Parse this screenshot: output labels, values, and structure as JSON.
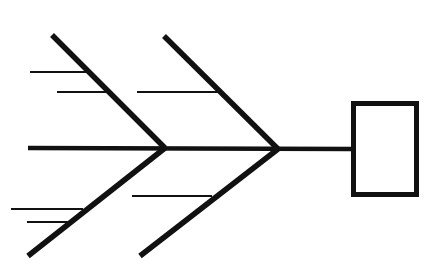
{
  "diagram": {
    "type": "fishbone",
    "width": 429,
    "height": 264,
    "stroke_color": "#111111",
    "background": "#ffffff",
    "spine": {
      "x1": 28,
      "y1": 148,
      "x2": 352,
      "y2": 149,
      "width": 4.5
    },
    "head_box": {
      "x": 353.5,
      "y": 103.5,
      "w": 63,
      "h": 91,
      "stroke_width": 5
    },
    "bones": [
      {
        "id": "upper-left",
        "x1": 52,
        "y1": 35,
        "x2": 165,
        "y2": 148,
        "width": 5.5
      },
      {
        "id": "upper-right",
        "x1": 164,
        "y1": 36,
        "x2": 278,
        "y2": 149,
        "width": 5.5
      },
      {
        "id": "lower-left",
        "x1": 28,
        "y1": 256,
        "x2": 165,
        "y2": 148,
        "width": 5.5
      },
      {
        "id": "lower-right",
        "x1": 140,
        "y1": 256,
        "x2": 278,
        "y2": 149,
        "width": 5.5
      }
    ],
    "twigs": [
      {
        "bone": "upper-left",
        "x1": 30,
        "y1": 72,
        "x2": 89,
        "y2": 72,
        "width": 2.2
      },
      {
        "bone": "upper-left",
        "x1": 57,
        "y1": 92,
        "x2": 108,
        "y2": 92,
        "width": 2.2
      },
      {
        "bone": "upper-right",
        "x1": 137,
        "y1": 92,
        "x2": 221,
        "y2": 92,
        "width": 2.2
      },
      {
        "bone": "lower-left",
        "x1": 11,
        "y1": 209,
        "x2": 83,
        "y2": 209,
        "width": 2.2
      },
      {
        "bone": "lower-left",
        "x1": 27,
        "y1": 222,
        "x2": 68,
        "y2": 222,
        "width": 2.2
      },
      {
        "bone": "lower-right",
        "x1": 132,
        "y1": 196,
        "x2": 212,
        "y2": 196,
        "width": 2.2
      }
    ]
  }
}
